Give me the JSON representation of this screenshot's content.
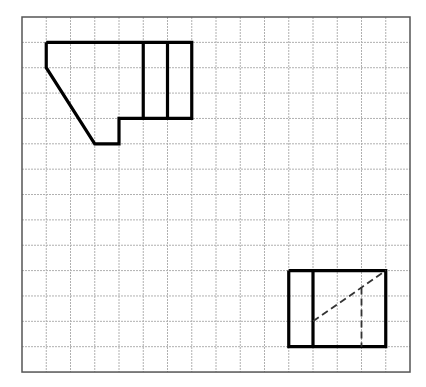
{
  "diagram": {
    "type": "grid-drawing",
    "grid": {
      "columns": 16,
      "rows": 14,
      "origin_px": [
        22,
        17
      ],
      "cell_w_px": 24.25,
      "cell_h_px": 25.36,
      "line_color": "#b0b0b0",
      "border_color": "#555555"
    },
    "stroke_color": "#000000",
    "shapes": [
      {
        "name": "figure-top-left",
        "outline": [
          [
            1,
            1
          ],
          [
            7,
            1
          ],
          [
            7,
            4
          ],
          [
            4,
            4
          ],
          [
            4,
            5
          ],
          [
            3,
            5
          ],
          [
            1,
            2
          ],
          [
            1,
            1
          ]
        ],
        "solid_lines": [
          [
            [
              5,
              1
            ],
            [
              5,
              4
            ]
          ],
          [
            [
              6,
              1
            ],
            [
              6,
              4
            ]
          ]
        ],
        "dashed_lines": []
      },
      {
        "name": "figure-bottom-right",
        "outline": [
          [
            11,
            10
          ],
          [
            15,
            10
          ],
          [
            15,
            13
          ],
          [
            11,
            13
          ],
          [
            11,
            10
          ]
        ],
        "solid_lines": [
          [
            [
              12,
              10
            ],
            [
              12,
              13
            ]
          ]
        ],
        "dashed_lines": [
          [
            [
              12,
              12
            ],
            [
              15,
              10
            ]
          ],
          [
            [
              14,
              10.667
            ],
            [
              14,
              13
            ]
          ]
        ]
      }
    ]
  }
}
